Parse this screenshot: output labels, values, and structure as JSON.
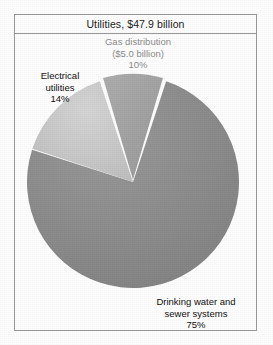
{
  "figure": {
    "title": "Utilities, $47.9 billion",
    "frame_color": "#9a9a9a",
    "background_color": "#ffffff"
  },
  "labels": {
    "gas": {
      "line1": "Gas distribution",
      "line2": "($5.0 billion)",
      "line3": "10%",
      "color": "#8d8d8d"
    },
    "electrical": {
      "line1": "Electrical",
      "line2": "utilities",
      "line3": "14%",
      "color": "#111111"
    },
    "water": {
      "line1": "Drinking water and",
      "line2": "sewer systems",
      "line3": "75%",
      "color": "#111111"
    }
  },
  "chart_data": {
    "type": "pie",
    "title": "Utilities, $47.9 billion",
    "total_value": 47.9,
    "total_unit": "billion USD",
    "xlabel": "",
    "ylabel": "",
    "grid": false,
    "legend_position": "none",
    "labels_inline": true,
    "start_angle_deg": -18,
    "direction": "clockwise",
    "categories": [
      "Gas distribution",
      "Drinking water and sewer systems",
      "Electrical utilities"
    ],
    "values": [
      10,
      75,
      14
    ],
    "value_unit": "percent",
    "slices": [
      {
        "name": "Gas distribution",
        "percent": 10,
        "amount": 5.0,
        "amount_text": "($5.0 billion)",
        "percent_text": "10%",
        "color": "#a3a3a3",
        "exploded": true,
        "start_angle_deg": -18,
        "end_angle_deg": 18
      },
      {
        "name": "Drinking water and sewer systems",
        "percent": 75,
        "percent_text": "75%",
        "color": "#8b8b8b",
        "exploded": false,
        "start_angle_deg": 18,
        "end_angle_deg": 288
      },
      {
        "name": "Electrical utilities",
        "percent": 14,
        "percent_text": "14%",
        "color": "#c6c6c6",
        "exploded": false,
        "start_angle_deg": 288,
        "end_angle_deg": 342
      }
    ],
    "geometry": {
      "center_x": 133,
      "center_y": 182,
      "radius": 106
    }
  }
}
